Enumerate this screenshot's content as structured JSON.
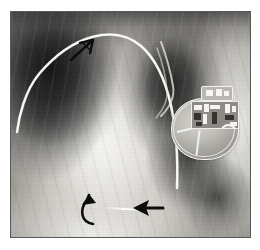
{
  "figure": {
    "modality": "X-ray",
    "view": "frontal chest radiograph, left hemithorax",
    "border_color": "#5a5a5a",
    "background_color": "#ffffff"
  },
  "frame": {
    "x": 10,
    "y": 11,
    "width": 239,
    "height": 225
  },
  "anatomy": [
    {
      "name": "right-lung-field",
      "description": "dark aerated lung, image left",
      "tone": "dark"
    },
    {
      "name": "left-retrocardiac-lung-field",
      "description": "dark lung behind cardiac border",
      "tone": "dark"
    },
    {
      "name": "cardiac-silhouette",
      "description": "bright central heart and mediastinal shadow",
      "tone": "bright"
    },
    {
      "name": "diaphragm",
      "description": "bright hemidiaphragm and upper abdomen",
      "tone": "bright"
    },
    {
      "name": "chest-wall-soft-tissue",
      "description": "bright axillary soft tissue band at image right",
      "tone": "bright"
    },
    {
      "name": "rib-shadows",
      "description": "oblique repeating rib and scan line texture",
      "tone": "mid"
    }
  ],
  "device": {
    "name": "pacemaker-generator",
    "label": "implanted pulse generator",
    "shape": "rounded metallic can",
    "components": [
      {
        "name": "device-can",
        "label": "titanium can"
      },
      {
        "name": "device-header",
        "label": "connector header block"
      },
      {
        "name": "device-circuitry",
        "label": "internal circuit board"
      },
      {
        "name": "device-coil",
        "label": "internal coil / capacitor"
      },
      {
        "name": "device-battery-divider",
        "label": "battery divider line"
      }
    ]
  },
  "leads": [
    {
      "name": "pacing-lead-upper",
      "label": "pacing lead arcing from device header across upper mediastinum"
    },
    {
      "name": "pacing-lead-second",
      "label": "second lead looping over device header"
    },
    {
      "name": "lead-fragment-lower",
      "label": "bright lead fragment in lower cardiac region"
    }
  ],
  "annotations": [
    {
      "name": "arrow-upper-lead",
      "type": "open-arrow",
      "direction": "up-right",
      "points_to": "pacing-lead-upper",
      "x": 66,
      "y": 33
    },
    {
      "name": "arrow-curved-lower",
      "type": "curved-arrow",
      "direction": "up",
      "points_to": "lead-fragment-lower",
      "x": 74,
      "y": 190
    },
    {
      "name": "arrow-straight-lower",
      "type": "solid-arrow",
      "direction": "left",
      "points_to": "lead-fragment-lower",
      "x": 124,
      "y": 194
    }
  ],
  "colors": {
    "annotation_stroke": "#0d0d0d",
    "lead_bright": "#f7f6f2",
    "film_light": "#efeeea",
    "film_dark": "#141414",
    "frame_border": "#5a5a5a"
  }
}
